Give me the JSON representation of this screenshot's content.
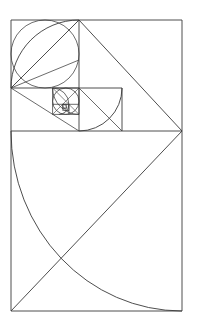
{
  "figure": {
    "background_color": "#ffffff",
    "stroke_color": "#3a3a3a",
    "canvas": {
      "width": 197,
      "height": 324
    },
    "outer_rectangle": {
      "x": 11,
      "y": 20,
      "width": 171,
      "height": 291
    },
    "golden_ratio": 1.618,
    "squares": [
      {
        "name": "square-1-large",
        "x": 11,
        "y": 131,
        "size": 180,
        "arc_center": "top-right",
        "arc_from": "top-left",
        "arc_to": "bottom-right"
      },
      {
        "name": "square-2",
        "x": 11,
        "y": 20,
        "size": 68,
        "arc_center": "top-left",
        "arc_from": "top-right",
        "arc_to": "bottom-left"
      },
      {
        "name": "square-3",
        "x": 79,
        "y": 88,
        "size": 43,
        "arc_center": "bottom-right",
        "arc_from": "bottom-left",
        "arc_to": "top-right"
      },
      {
        "name": "square-4",
        "x": 52.6,
        "y": 88,
        "size": 26.4,
        "arc_center": "bottom-left",
        "arc_from": "top-left",
        "arc_to": "bottom-right"
      },
      {
        "name": "square-5",
        "x": 52.6,
        "y": 104,
        "size": 16.3,
        "arc_center": "top-left",
        "arc_from": "top-right",
        "arc_to": "bottom-left"
      },
      {
        "name": "square-6",
        "x": 68.9,
        "y": 104,
        "size": 10.1,
        "arc_center": "bottom-right",
        "arc_from": "bottom-left",
        "arc_to": "top-right"
      },
      {
        "name": "square-7",
        "x": 62.7,
        "y": 104,
        "size": 6.2,
        "arc_center": "bottom-left",
        "arc_from": "top-left",
        "arc_to": "bottom-right"
      },
      {
        "name": "square-8",
        "x": 62.7,
        "y": 107.8,
        "size": 3.8,
        "arc_center": "top-left",
        "arc_from": "top-right",
        "arc_to": "bottom-left"
      }
    ],
    "circles": [
      {
        "name": "circle-large",
        "cx": 45,
        "cy": 54,
        "r": 34
      },
      {
        "name": "circle-small",
        "cx": 65.7,
        "cy": 99.5,
        "r": 13.2
      }
    ],
    "diagonals": [
      {
        "name": "diagonal-large-square",
        "x1": 11,
        "y1": 311,
        "x2": 182,
        "y2": 131
      },
      {
        "name": "diagonal-square-2",
        "x1": 11,
        "y1": 88,
        "x2": 79,
        "y2": 20
      },
      {
        "name": "diagonal-outer-upper",
        "x1": 79,
        "y1": 20,
        "x2": 182,
        "y2": 131
      },
      {
        "name": "diagonal-square-3",
        "x1": 79,
        "y1": 88,
        "x2": 122,
        "y2": 131
      },
      {
        "name": "diagonal-fan-a",
        "x1": 11,
        "y1": 88,
        "x2": 79,
        "y2": 88
      },
      {
        "name": "diagonal-fan-b",
        "x1": 11,
        "y1": 88,
        "x2": 79,
        "y2": 131
      }
    ],
    "divider_lines": [
      {
        "name": "horizontal-divider-main",
        "x1": 11,
        "y1": 131,
        "x2": 182,
        "y2": 131
      },
      {
        "name": "vertical-divider-upper",
        "x1": 79,
        "y1": 20,
        "x2": 79,
        "y2": 131
      },
      {
        "name": "horizontal-divider-upper",
        "x1": 11,
        "y1": 88,
        "x2": 122,
        "y2": 88
      },
      {
        "name": "vertical-divider-inner",
        "x1": 122,
        "y1": 88,
        "x2": 122,
        "y2": 131
      }
    ]
  }
}
